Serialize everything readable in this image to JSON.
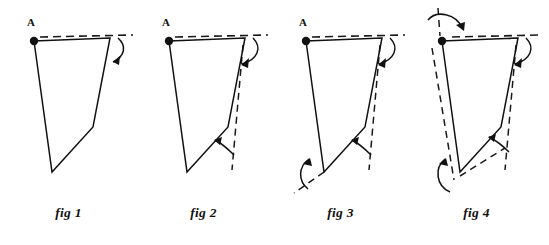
{
  "document": {
    "kind": "geometry-diagram",
    "description": "Four stages of a hinged quadrilateral linkage folding about pivot A",
    "background_color": "#ffffff",
    "ink_color": "#111111",
    "dash_color": "#1a1a1a"
  },
  "figures": [
    {
      "id": "fig1",
      "caption": "fig 1",
      "vertex_label": "A",
      "solid_polyline": "34,41 110,38 93,127 52,172 34,41",
      "dashed_segments": [
        "40,37 133,35"
      ],
      "arrows": [
        {
          "name": "rotation-arrow-top-right",
          "path": "M 118,38 C 127,46 125,56 113,62",
          "head": "113,62 119,57 119,64"
        }
      ],
      "stage_note": "initial closed shape, top bar aligned with dashed reference line"
    },
    {
      "id": "fig2",
      "caption": "fig 2",
      "vertex_label": "A",
      "solid_polyline": "34,41 110,38 93,127 52,172 34,41",
      "dashed_segments": [
        "40,37 133,35",
        "108,45 97,170"
      ],
      "arrows": [
        {
          "name": "rotation-arrow-top-right",
          "path": "M 118,38 C 127,48 122,60 107,64",
          "head": "107,64 114,59 113,67"
        },
        {
          "name": "rotation-arrow-lower-hinge",
          "path": "M 97,155 C 92,150 86,144 78,141",
          "head": "78,141 86,139 84,146"
        }
      ],
      "stage_note": "right side edge swung inward from its dashed original position"
    },
    {
      "id": "fig3",
      "caption": "fig 3",
      "vertex_label": "A",
      "solid_polyline": "34,41 110,38 93,127 52,172 34,41",
      "dashed_segments": [
        "40,37 133,35",
        "108,45 97,170",
        "52,172 22,192"
      ],
      "arrows": [
        {
          "name": "rotation-arrow-top-right",
          "path": "M 118,38 C 127,48 122,60 107,64",
          "head": "107,64 114,59 113,67"
        },
        {
          "name": "rotation-arrow-lower-hinge",
          "path": "M 97,155 C 92,150 86,144 78,141",
          "head": "78,141 86,139 84,146"
        },
        {
          "name": "rotation-arrow-bottom-left",
          "path": "M 38,186 C 28,178 28,166 38,158",
          "head": "38,158 32,164 40,165"
        }
      ],
      "stage_note": "bottom vertex also rotating, dashed trace of former lower edge"
    },
    {
      "id": "fig4",
      "caption": "fig 4",
      "vertex_label": "A",
      "solid_polyline": "34,41 110,38 93,127 52,172 34,41",
      "dashed_segments": [
        "40,37 133,35",
        "108,45 97,170",
        "30,10 30,40",
        "24,48 46,178",
        "52,172 96,148"
      ],
      "arrows": [
        {
          "name": "rotation-arrow-top-left",
          "path": "M 22,22 C 30,12 48,14 54,28",
          "head": "54,28 48,23 56,21"
        },
        {
          "name": "rotation-arrow-top-right",
          "path": "M 118,38 C 128,48 122,60 106,64",
          "head": "106,64 113,59 112,67"
        },
        {
          "name": "rotation-arrow-lower-hinge",
          "path": "M 100,152 C 95,147 88,141 80,138",
          "head": "80,138 88,136 86,143"
        },
        {
          "name": "rotation-arrow-bottom-left",
          "path": "M 40,188 C 28,182 28,166 38,158",
          "head": "38,158 32,164 40,165"
        }
      ],
      "stage_note": "all four hinges shown rotating, full set of dashed original positions"
    }
  ]
}
